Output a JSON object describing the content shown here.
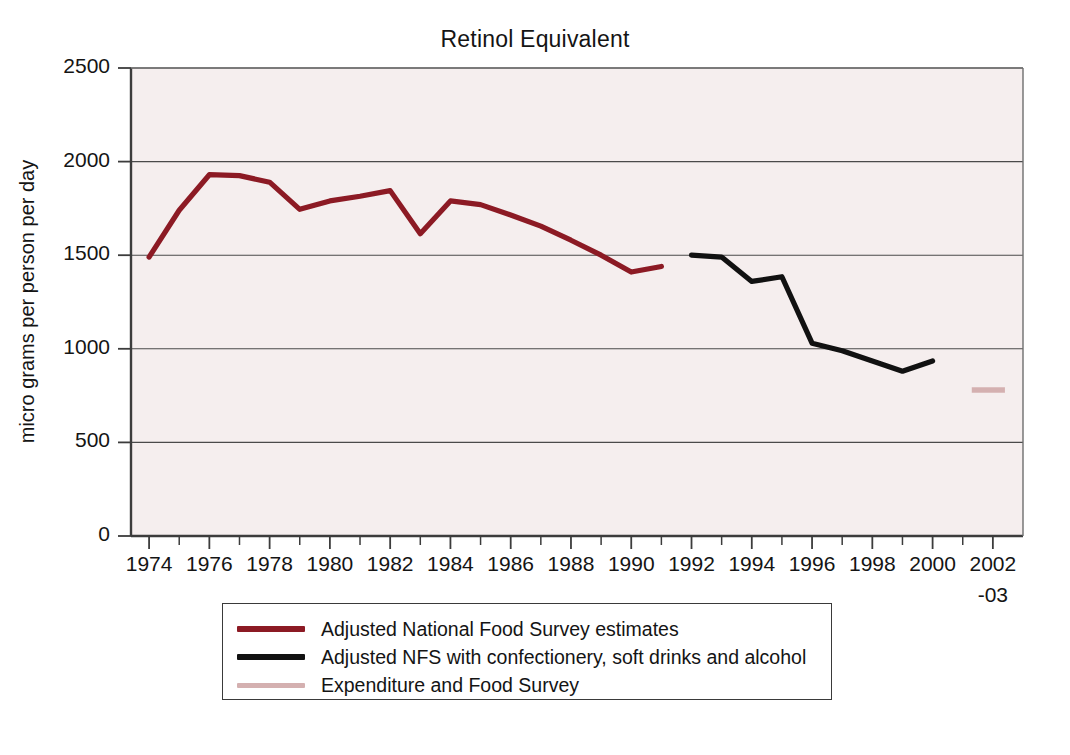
{
  "chart_data": {
    "type": "line",
    "title": "Retinol Equivalent",
    "xlabel": "",
    "ylabel": "micro grams per person per day",
    "ylim": [
      0,
      2500
    ],
    "yticks": [
      0,
      500,
      1000,
      1500,
      2000,
      2500
    ],
    "ytick_labels": [
      "0",
      "500",
      "1000",
      "1500",
      "2000",
      "2500"
    ],
    "xlim": [
      1973.4,
      2003.0
    ],
    "xtick_labels": [
      "1974",
      "1976",
      "1978",
      "1980",
      "1982",
      "1984",
      "1986",
      "1988",
      "1990",
      "1992",
      "1994",
      "1996",
      "1998",
      "2000",
      "2002"
    ],
    "xtick_label_sub": "-03",
    "grid": "horizontal",
    "legend_position": "below-plot",
    "series": [
      {
        "name": "Adjusted National Food Survey estimates",
        "color": "#8c1a24",
        "x": [
          1974,
          1975,
          1976,
          1977,
          1978,
          1979,
          1980,
          1981,
          1982,
          1983,
          1984,
          1985,
          1986,
          1987,
          1988,
          1989,
          1990,
          1991
        ],
        "values": [
          1490,
          1740,
          1930,
          1925,
          1890,
          1745,
          1790,
          1815,
          1845,
          1615,
          1790,
          1770,
          1715,
          1655,
          1580,
          1500,
          1410,
          1440
        ]
      },
      {
        "name": "Adjusted NFS with confectionery, soft drinks and alcohol",
        "color": "#111111",
        "x": [
          1992,
          1993,
          1994,
          1995,
          1996,
          1997,
          1998,
          1999,
          2000
        ],
        "values": [
          1500,
          1490,
          1360,
          1385,
          1030,
          990,
          935,
          880,
          935
        ]
      },
      {
        "name": "Expenditure and Food Survey",
        "color": "#d4b0b0",
        "x": [
          2001.3,
          2002.4
        ],
        "values": [
          780,
          780
        ]
      }
    ]
  },
  "legend": {
    "items": [
      {
        "label": "Adjusted National Food Survey estimates",
        "color": "#8c1a24"
      },
      {
        "label": "Adjusted NFS with confectionery, soft drinks and alcohol",
        "color": "#111111"
      },
      {
        "label": "Expenditure and Food Survey",
        "color": "#d4b0b0"
      }
    ]
  }
}
